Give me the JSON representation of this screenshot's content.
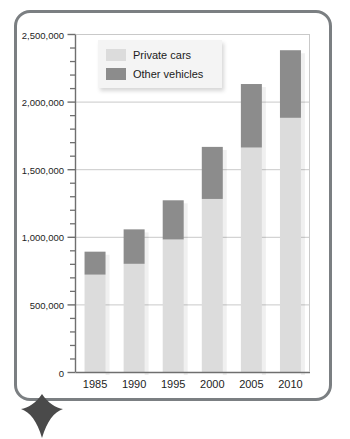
{
  "chart_data": {
    "type": "bar",
    "subtype": "stacked-vertical",
    "title": "",
    "xlabel": "",
    "ylabel": "",
    "categories": [
      "1985",
      "1990",
      "1995",
      "2000",
      "2005",
      "2010"
    ],
    "series": [
      {
        "name": "Private cars",
        "color": "#dcdcdc",
        "values": [
          720000,
          800000,
          980000,
          1280000,
          1660000,
          1880000
        ]
      },
      {
        "name": "Other vehicles",
        "color": "#8c8c8c",
        "values": [
          170000,
          255000,
          290000,
          385000,
          470000,
          500000
        ]
      }
    ],
    "totals": [
      890000,
      1055000,
      1270000,
      1665000,
      2130000,
      2380000
    ],
    "ylim": [
      0,
      2500000
    ],
    "y_major_tick_interval": 500000,
    "y_minor_tick_interval": 100000,
    "y_major_tick_labels": [
      "0",
      "500,000",
      "1,000,000",
      "1,500,000",
      "2,000,000",
      "2,500,000"
    ],
    "y_major_tick_values": [
      0,
      500000,
      1000000,
      1500000,
      2000000,
      2500000
    ],
    "grid": {
      "horizontal": true,
      "vertical": false,
      "color": "#c9c9c9"
    },
    "legend": {
      "position": "top-left-inside",
      "entries": [
        {
          "label": "Private cars",
          "color": "#dcdcdc"
        },
        {
          "label": "Other vehicles",
          "color": "#8c8c8c"
        }
      ]
    },
    "axis_color": "#6f6f6f",
    "plot_background": "#ffffff"
  },
  "frame": {
    "border_color": "#7b7f82",
    "pointer_color": "#4a4a4a"
  },
  "icons": {
    "pointer": "triangle-pointer-icon"
  }
}
